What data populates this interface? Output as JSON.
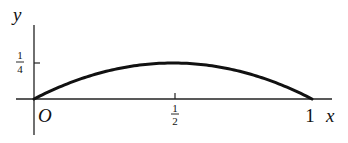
{
  "chart_data": {
    "type": "line",
    "title": "",
    "xlabel": "x",
    "ylabel": "y",
    "origin_label": "O",
    "x_ticks": [
      {
        "value": 0.5,
        "label": "1/2",
        "num": "1",
        "den": "2"
      },
      {
        "value": 1,
        "label": "1"
      }
    ],
    "y_ticks": [
      {
        "value": 0.25,
        "label": "1/4",
        "num": "1",
        "den": "4"
      }
    ],
    "xlim": [
      0,
      1
    ],
    "ylim": [
      0,
      0.25
    ],
    "grid": false,
    "series": [
      {
        "name": "y = x(1 - x)",
        "x": [
          0,
          0.1,
          0.2,
          0.3,
          0.4,
          0.5,
          0.6,
          0.7,
          0.8,
          0.9,
          1.0
        ],
        "y": [
          0,
          0.09,
          0.16,
          0.21,
          0.24,
          0.25,
          0.24,
          0.21,
          0.16,
          0.09,
          0
        ]
      }
    ],
    "colors": {
      "curve": "#111111",
      "axes": "#222222"
    }
  }
}
